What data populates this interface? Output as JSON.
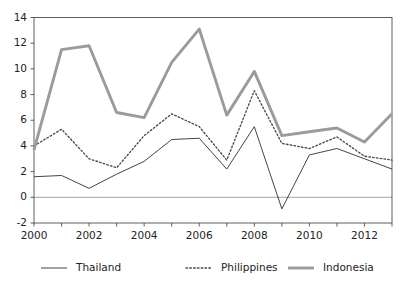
{
  "chart_data": {
    "type": "line",
    "title": "",
    "subtitle": "",
    "xlabel": "",
    "ylabel": "",
    "x": [
      2000,
      2001,
      2002,
      2003,
      2004,
      2005,
      2006,
      2007,
      2008,
      2009,
      2010,
      2011,
      2012,
      2013
    ],
    "xtick_labels": [
      "2000",
      "2002",
      "2004",
      "2006",
      "2008",
      "2010",
      "2012"
    ],
    "xtick_values": [
      2000,
      2002,
      2004,
      2006,
      2008,
      2010,
      2012
    ],
    "ytick_labels": [
      "-2",
      "0",
      "2",
      "4",
      "6",
      "8",
      "10",
      "12",
      "14"
    ],
    "ytick_values": [
      -2,
      0,
      2,
      4,
      6,
      8,
      10,
      12,
      14
    ],
    "xlim": [
      2000,
      2013
    ],
    "ylim": [
      -2,
      14
    ],
    "grid": false,
    "zero_line": true,
    "legend_position": "bottom",
    "series": [
      {
        "name": "Thailand",
        "style": "solid-thin",
        "color": "#3a3a3a",
        "values": [
          1.6,
          1.7,
          0.7,
          1.8,
          2.8,
          4.5,
          4.6,
          2.2,
          5.5,
          -0.9,
          3.3,
          3.8,
          3.0,
          2.2
        ]
      },
      {
        "name": "Philippines",
        "style": "dotted",
        "color": "#4a4a4a",
        "values": [
          4.0,
          5.3,
          3.0,
          2.3,
          4.8,
          6.5,
          5.5,
          2.9,
          8.3,
          4.2,
          3.8,
          4.7,
          3.2,
          2.9
        ]
      },
      {
        "name": "Indonesia",
        "style": "solid-thick",
        "color": "#9b9b9b",
        "values": [
          3.7,
          11.5,
          11.8,
          6.6,
          6.2,
          10.5,
          13.1,
          6.4,
          9.8,
          4.8,
          5.1,
          5.4,
          4.3,
          6.5
        ]
      }
    ]
  },
  "legend": {
    "items": [
      {
        "label": "Thailand"
      },
      {
        "label": "Philippines"
      },
      {
        "label": "Indonesia"
      }
    ]
  },
  "colors": {
    "axis": "#4d4d4d",
    "zero_line": "#b5b5b5",
    "thailand": "#3a3a3a",
    "philippines": "#4a4a4a",
    "indonesia": "#9b9b9b",
    "background": "#ffffff"
  }
}
